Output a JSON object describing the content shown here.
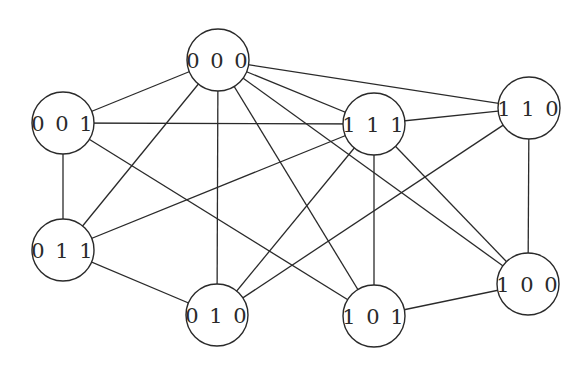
{
  "diagram": {
    "type": "graph",
    "nodes": [
      {
        "id": "000",
        "label": "0 0 0",
        "x": 218,
        "y": 60
      },
      {
        "id": "001",
        "label": "0 0 1",
        "x": 63,
        "y": 123
      },
      {
        "id": "111",
        "label": "1 1 1",
        "x": 374,
        "y": 124
      },
      {
        "id": "110",
        "label": "1 1 0",
        "x": 529,
        "y": 108
      },
      {
        "id": "011",
        "label": "0 1 1",
        "x": 63,
        "y": 250
      },
      {
        "id": "010",
        "label": "0 1 0",
        "x": 217,
        "y": 315
      },
      {
        "id": "101",
        "label": "1 0 1",
        "x": 374,
        "y": 316
      },
      {
        "id": "100",
        "label": "1 0 0",
        "x": 528,
        "y": 284
      }
    ],
    "edges": [
      [
        "000",
        "001"
      ],
      [
        "000",
        "011"
      ],
      [
        "000",
        "010"
      ],
      [
        "000",
        "101"
      ],
      [
        "000",
        "100"
      ],
      [
        "000",
        "111"
      ],
      [
        "000",
        "110"
      ],
      [
        "001",
        "111"
      ],
      [
        "001",
        "011"
      ],
      [
        "001",
        "101"
      ],
      [
        "111",
        "110"
      ],
      [
        "111",
        "011"
      ],
      [
        "111",
        "010"
      ],
      [
        "111",
        "101"
      ],
      [
        "111",
        "100"
      ],
      [
        "110",
        "010"
      ],
      [
        "110",
        "100"
      ],
      [
        "011",
        "010"
      ],
      [
        "101",
        "100"
      ]
    ],
    "node_radius": 31
  }
}
